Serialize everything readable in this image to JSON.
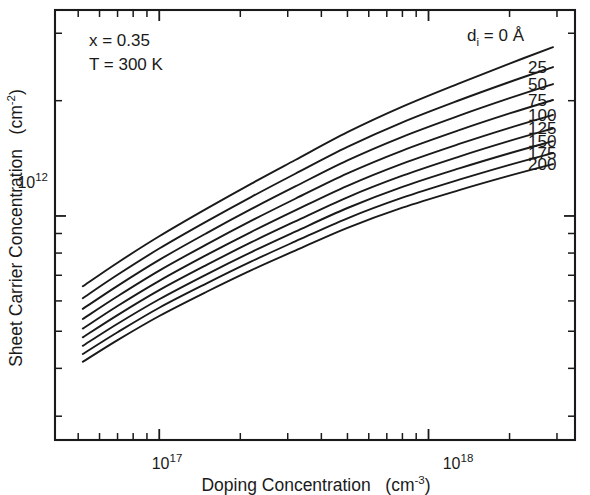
{
  "figure": {
    "background_color": "#ffffff",
    "line_color": "#1a1a1a"
  },
  "annotations": {
    "alloy_composition": "x = 0.35",
    "temperature": "T = 300 K"
  },
  "axes": {
    "x": {
      "title_main": "Doping Concentration",
      "title_units": "(cm",
      "title_units_exp": "-3",
      "title_units_close": ")",
      "tick_labels": [
        "10",
        "10"
      ],
      "tick_exponents": [
        "17",
        "18"
      ],
      "scale": "log",
      "range_min": 4.1e+16,
      "range_max": 3.5e+18
    },
    "y": {
      "title_main": "Sheet Carrier Concentration",
      "title_units": "(cm",
      "title_units_exp": "-2",
      "title_units_close": ")",
      "tick_labels": [
        "10"
      ],
      "tick_exponents": [
        "12"
      ],
      "scale": "log",
      "range_min": 260000000000.0,
      "range_max": 3450000000000.0
    }
  },
  "legend": {
    "header_symbol": "d",
    "header_subscript": "i",
    "header_equals": " = 0 Å",
    "labels": [
      "25",
      "50",
      "75",
      "100",
      "125",
      "150",
      "175",
      "200"
    ]
  },
  "chart_data": {
    "type": "line",
    "title": "",
    "xlabel": "Doping Concentration  (cm-3)",
    "ylabel": "Sheet Carrier Concentration  (cm-2)",
    "xscale": "log",
    "yscale": "log",
    "xlim": [
      4.1e+16,
      3.5e+18
    ],
    "ylim": [
      260000000000.0,
      3450000000000.0
    ],
    "grid": false,
    "legend_position": "inside-right",
    "annotations": [
      "x = 0.35",
      "T = 300 K"
    ],
    "x": [
      5.2e+16,
      7e+16,
      1e+17,
      1.5e+17,
      2.2e+17,
      3.2e+17,
      5e+17,
      8e+17,
      1.3e+18,
      2e+18,
      2.9e+18
    ],
    "series": [
      {
        "name": "d_i = 0 A",
        "spacer_angstrom": 0,
        "values": [
          655000000000.0,
          755000000000.0,
          885000000000.0,
          1045000000000.0,
          1215000000000.0,
          1400000000000.0,
          1655000000000.0,
          1930000000000.0,
          2220000000000.0,
          2500000000000.0,
          2760000000000.0
        ]
      },
      {
        "name": "d_i = 25 A",
        "spacer_angstrom": 25,
        "values": [
          610000000000.0,
          702000000000.0,
          822000000000.0,
          968000000000.0,
          1122000000000.0,
          1289000000000.0,
          1515000000000.0,
          1756000000000.0,
          2005000000000.0,
          2238000000000.0,
          2448000000000.0
        ]
      },
      {
        "name": "d_i = 50 A",
        "spacer_angstrom": 50,
        "values": [
          572000000000.0,
          657000000000.0,
          768000000000.0,
          902000000000.0,
          1043000000000.0,
          1194000000000.0,
          1397000000000.0,
          1610000000000.0,
          1828000000000.0,
          2030000000000.0,
          2210000000000.0
        ]
      },
      {
        "name": "d_i = 75 A",
        "spacer_angstrom": 75,
        "values": [
          538000000000.0,
          617000000000.0,
          720000000000.0,
          843000000000.0,
          972000000000.0,
          1109000000000.0,
          1292000000000.0,
          1482000000000.0,
          1675000000000.0,
          1852000000000.0,
          2008000000000.0
        ]
      },
      {
        "name": "d_i = 100 A",
        "spacer_angstrom": 100,
        "values": [
          508000000000.0,
          582000000000.0,
          677000000000.0,
          791000000000.0,
          909000000000.0,
          1034000000000.0,
          1199000000000.0,
          1370000000000.0,
          1542000000000.0,
          1699000000000.0,
          1836000000000.0
        ]
      },
      {
        "name": "d_i = 125 A",
        "spacer_angstrom": 125,
        "values": [
          482000000000.0,
          551000000000.0,
          640000000000.0,
          745000000000.0,
          854000000000.0,
          968000000000.0,
          1119000000000.0,
          1274000000000.0,
          1429000000000.0,
          1570000000000.0,
          1692000000000.0
        ]
      },
      {
        "name": "d_i = 150 A",
        "spacer_angstrom": 150,
        "values": [
          458000000000.0,
          523000000000.0,
          606000000000.0,
          704000000000.0,
          805000000000.0,
          910000000000.0,
          1049000000000.0,
          1191000000000.0,
          1331000000000.0,
          1458000000000.0,
          1568000000000.0
        ]
      },
      {
        "name": "d_i = 175 A",
        "spacer_angstrom": 175,
        "values": [
          436000000000.0,
          497000000000.0,
          576000000000.0,
          667000000000.0,
          761000000000.0,
          858000000000.0,
          986000000000.0,
          1116000000000.0,
          1244000000000.0,
          1360000000000.0,
          1460000000000.0
        ]
      },
      {
        "name": "d_i = 200 A",
        "spacer_angstrom": 200,
        "values": [
          416000000000.0,
          474000000000.0,
          548000000000.0,
          634000000000.0,
          722000000000.0,
          812000000000.0,
          931000000000.0,
          1051000000000.0,
          1168000000000.0,
          1274000000000.0,
          1366000000000.0
        ]
      }
    ]
  }
}
